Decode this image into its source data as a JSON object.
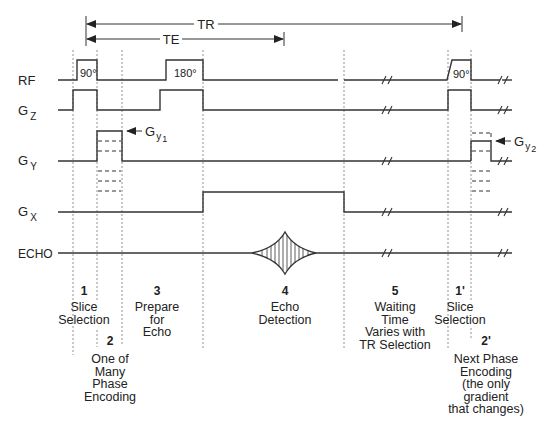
{
  "diagram": {
    "type": "mri-spin-echo-pulse-sequence",
    "intervals": {
      "tr_label": "TR",
      "te_label": "TE"
    },
    "channels": [
      {
        "id": "rf",
        "label": "RF",
        "subscript": ""
      },
      {
        "id": "gz",
        "label": "G",
        "subscript": "Z"
      },
      {
        "id": "gy",
        "label": "G",
        "subscript": "Y"
      },
      {
        "id": "gx",
        "label": "G",
        "subscript": "X"
      },
      {
        "id": "echo",
        "label": "ECHO",
        "subscript": ""
      }
    ],
    "pulses": {
      "rf_90_first": "90°",
      "rf_180": "180°",
      "rf_90_next": "90°"
    },
    "annotations": {
      "gy1": {
        "main": "G",
        "sub": "y",
        "index": "1"
      },
      "gy2": {
        "main": "G",
        "sub": "y",
        "index": "2"
      }
    },
    "segments": [
      {
        "number": "1",
        "lines": [
          "Slice",
          "Selection"
        ]
      },
      {
        "number": "2",
        "lines": [
          "One of",
          "Many",
          "Phase",
          "Encoding"
        ]
      },
      {
        "number": "3",
        "lines": [
          "Prepare",
          "for",
          "Echo"
        ]
      },
      {
        "number": "4",
        "lines": [
          "Echo",
          "Detection"
        ]
      },
      {
        "number": "5",
        "lines": [
          "Waiting",
          "Time",
          "Varies with",
          "TR Selection"
        ]
      },
      {
        "number": "1'",
        "lines": [
          "Slice",
          "Selection"
        ]
      },
      {
        "number": "2'",
        "lines": [
          "Next Phase",
          "Encoding",
          "(the only",
          "gradient",
          "that changes)"
        ]
      }
    ]
  }
}
